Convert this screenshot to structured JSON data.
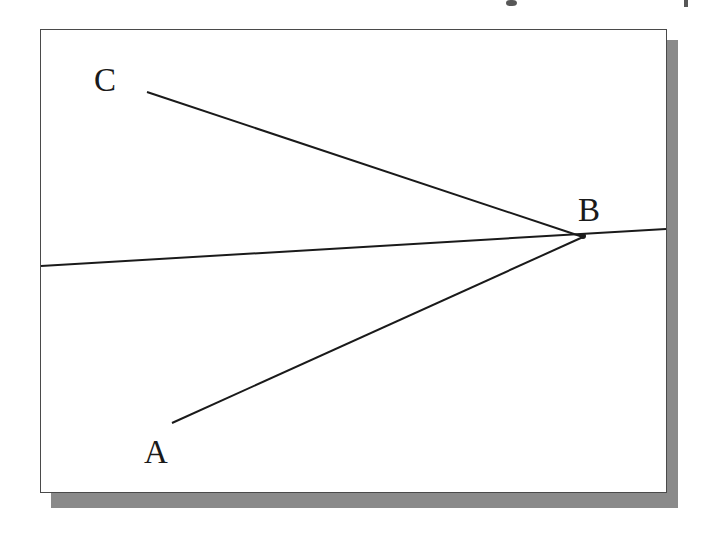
{
  "figure": {
    "background_color": "#ffffff",
    "frame_border_color": "#4a4a4a",
    "shadow_color": "#8a8a8a",
    "stroke_color": "#1a1a1a"
  },
  "labels": {
    "a": "A",
    "b": "B",
    "c": "C"
  },
  "chart_data": {
    "type": "scatter",
    "xlabel": "",
    "ylabel": "",
    "xlim": [
      40,
      667
    ],
    "ylim": [
      29,
      493
    ],
    "grid": false,
    "legend_position": "none",
    "points": [
      {
        "name": "C",
        "label": "C",
        "x": 147,
        "y": 92
      },
      {
        "name": "B",
        "label": "B",
        "x": 583,
        "y": 237
      },
      {
        "name": "A",
        "label": "A",
        "x": 172,
        "y": 423
      }
    ],
    "series": [
      {
        "name": "ray-CB",
        "type": "segment",
        "x": [
          147,
          583
        ],
        "y": [
          92,
          237
        ]
      },
      {
        "name": "ray-AB",
        "type": "segment",
        "x": [
          172,
          583
        ],
        "y": [
          423,
          237
        ]
      },
      {
        "name": "reference-line",
        "type": "segment",
        "x": [
          41,
          666
        ],
        "y": [
          266,
          229
        ]
      }
    ],
    "annotations": [
      {
        "text": "C",
        "x": 104,
        "y": 80,
        "anchor": "ray endpoint"
      },
      {
        "text": "B",
        "x": 588,
        "y": 210,
        "anchor": "vertex"
      },
      {
        "text": "A",
        "x": 154,
        "y": 452,
        "anchor": "ray endpoint"
      }
    ]
  }
}
